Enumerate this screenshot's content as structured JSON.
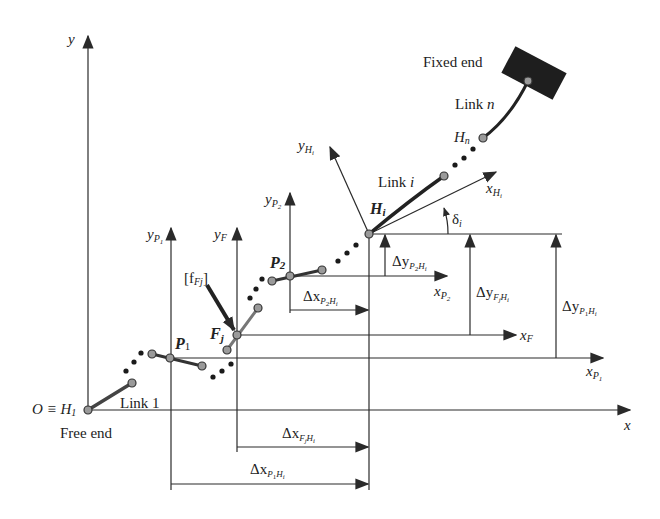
{
  "diagram": {
    "colors": {
      "line": "#2a2a2a",
      "link": "#333333",
      "joint_fill": "#9a9a9a",
      "fixed_block": "#1e1e1e",
      "background": "#ffffff"
    },
    "axes": {
      "global_x": "x",
      "global_y": "y",
      "origin": "O ≡ H",
      "origin_sub": "1"
    },
    "frames": {
      "y_P1": {
        "base": "y",
        "sub": "P",
        "subsub": "1"
      },
      "y_F": {
        "base": "y",
        "sub": "F"
      },
      "y_P2": {
        "base": "y",
        "sub": "P",
        "subsub": "2"
      },
      "y_Hi": {
        "base": "y",
        "sub": "H",
        "subsub": "i"
      },
      "x_Hi": {
        "base": "x",
        "sub": "H",
        "subsub": "i"
      },
      "x_P1": {
        "base": "x",
        "sub": "P",
        "subsub": "1"
      },
      "x_P2": {
        "base": "x",
        "sub": "P",
        "subsub": "2"
      },
      "x_F": {
        "base": "x",
        "sub": "F"
      }
    },
    "points": {
      "P1": {
        "base": "P",
        "sub": "1"
      },
      "P2": {
        "base": "P",
        "sub": "2"
      },
      "Fj": {
        "base": "F",
        "sub": "j"
      },
      "Hi": {
        "base": "H",
        "sub": "i"
      },
      "Hn": {
        "base": "H",
        "sub": "n"
      }
    },
    "labels": {
      "free_end": "Free end",
      "fixed_end": "Fixed end",
      "link_1": "Link 1",
      "link_i_prefix": "Link ",
      "link_i_var": "i",
      "link_n_prefix": "Link ",
      "link_n_var": "n",
      "force": "[f",
      "force_sub": "Fj",
      "force_close": "]",
      "angle": "δ",
      "angle_sub": "i"
    },
    "dimensions": {
      "dx_P2Hi": {
        "delta": "Δx",
        "sub": "P",
        "subsub": "2",
        "tail": "H",
        "tailsub": "i"
      },
      "dx_FjHi": {
        "delta": "Δx",
        "sub": "F",
        "subsub": "j",
        "tail": "H",
        "tailsub": "i"
      },
      "dx_P1Hi": {
        "delta": "Δx",
        "sub": "P",
        "subsub": "1",
        "tail": "H",
        "tailsub": "i"
      },
      "dy_P2Hi": {
        "delta": "Δy",
        "sub": "P",
        "subsub": "2",
        "tail": "H",
        "tailsub": "i"
      },
      "dy_FjHi": {
        "delta": "Δy",
        "sub": "F",
        "subsub": "j",
        "tail": "H",
        "tailsub": "i"
      },
      "dy_P1Hi": {
        "delta": "Δy",
        "sub": "P",
        "subsub": "1",
        "tail": "H",
        "tailsub": "i"
      }
    }
  }
}
